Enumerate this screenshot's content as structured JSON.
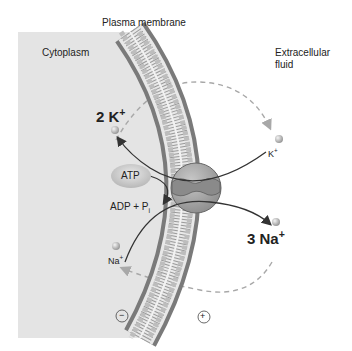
{
  "title": "Plasma membrane",
  "regions": {
    "inside": "Cytoplasm",
    "outside_line1": "Extracellular",
    "outside_line2": "fluid"
  },
  "ions": {
    "k_in_count": "2 K",
    "k_in_charge": "+",
    "k_out": "K",
    "k_out_charge": "+",
    "na_out_count": "3 Na",
    "na_out_charge": "+",
    "na_in": "Na",
    "na_in_charge": "+"
  },
  "energy": {
    "atp": "ATP",
    "products": "ADP + P",
    "products_sub": "i"
  },
  "charges": {
    "inside": "−",
    "outside": "+"
  },
  "colors": {
    "cytoplasm": "#e4e4e4",
    "membrane_head": "#8a8a8a",
    "pump": "#9a9a9a",
    "arrow": "#333333",
    "dashed": "#a8a8a8"
  }
}
